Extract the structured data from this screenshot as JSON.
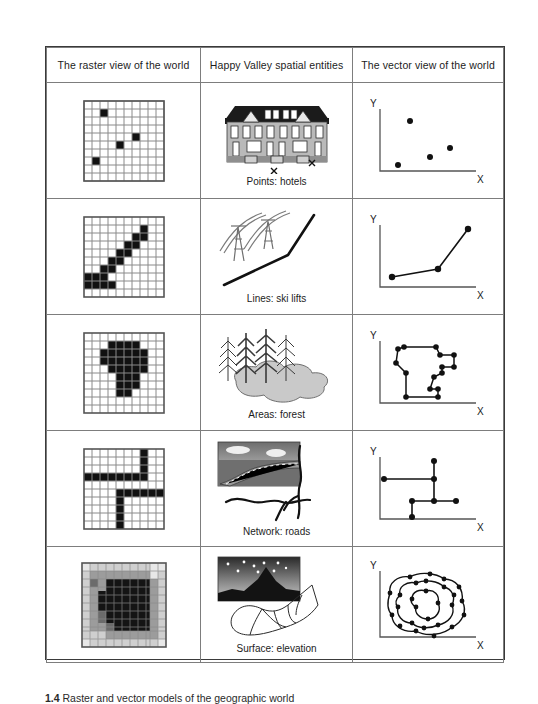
{
  "figure": {
    "caption_number": "1.4",
    "caption_text": "Raster and vector models of the geographic world"
  },
  "table": {
    "headers": [
      "The raster view of the world",
      "Happy Valley spatial entities",
      "The vector view of the world"
    ],
    "axis_labels": {
      "y": "Y",
      "x": "X"
    },
    "rows": [
      {
        "id": "points",
        "caption": "Points: hotels",
        "middle_art": "hotel-building-illustration",
        "middle_markers": "x-marks",
        "raster": {
          "type": "binary",
          "cols": 10,
          "rows": 10,
          "filled_cells": [
            [
              2,
              1
            ],
            [
              6,
              4
            ],
            [
              4,
              5
            ],
            [
              1,
              7
            ]
          ]
        },
        "vector": {
          "type": "points",
          "points": [
            [
              28,
              18
            ],
            [
              62,
              55
            ],
            [
              46,
              66
            ],
            [
              18,
              78
            ]
          ]
        }
      },
      {
        "id": "lines",
        "caption": "Lines: ski lifts",
        "middle_art": "ski-lift-towers-illustration",
        "raster": {
          "type": "binary",
          "cols": 10,
          "rows": 10,
          "filled_cells": [
            [
              7,
              1
            ],
            [
              7,
              2
            ],
            [
              6,
              2
            ],
            [
              6,
              3
            ],
            [
              5,
              3
            ],
            [
              5,
              4
            ],
            [
              4,
              4
            ],
            [
              4,
              5
            ],
            [
              3,
              5
            ],
            [
              3,
              6
            ],
            [
              2,
              6
            ],
            [
              1,
              7
            ],
            [
              2,
              7
            ],
            [
              3,
              7
            ],
            [
              0,
              7
            ],
            [
              0,
              8
            ],
            [
              1,
              8
            ],
            [
              2,
              8
            ],
            [
              3,
              8
            ]
          ]
        },
        "vector": {
          "type": "polyline",
          "points": [
            [
              12,
              78
            ],
            [
              62,
              62
            ],
            [
              88,
              12
            ]
          ]
        }
      },
      {
        "id": "areas",
        "caption": "Areas: forest",
        "middle_art": "forest-trees-and-lake-illustration",
        "raster": {
          "type": "binary",
          "cols": 10,
          "rows": 10,
          "filled_cells": [
            [
              3,
              1
            ],
            [
              4,
              1
            ],
            [
              5,
              1
            ],
            [
              6,
              1
            ],
            [
              2,
              2
            ],
            [
              3,
              2
            ],
            [
              4,
              2
            ],
            [
              5,
              2
            ],
            [
              6,
              2
            ],
            [
              7,
              2
            ],
            [
              2,
              3
            ],
            [
              3,
              3
            ],
            [
              4,
              3
            ],
            [
              5,
              3
            ],
            [
              6,
              3
            ],
            [
              7,
              3
            ],
            [
              3,
              4
            ],
            [
              4,
              4
            ],
            [
              5,
              4
            ],
            [
              6,
              4
            ],
            [
              7,
              4
            ],
            [
              4,
              5
            ],
            [
              5,
              5
            ],
            [
              6,
              5
            ],
            [
              4,
              6
            ],
            [
              5,
              6
            ],
            [
              6,
              6
            ],
            [
              4,
              7
            ],
            [
              5,
              7
            ]
          ]
        },
        "vector": {
          "type": "polygon",
          "points": [
            [
              24,
              12
            ],
            [
              56,
              12
            ],
            [
              60,
              22
            ],
            [
              78,
              22
            ],
            [
              78,
              38
            ],
            [
              62,
              38
            ],
            [
              62,
              48
            ],
            [
              52,
              52
            ],
            [
              48,
              70
            ],
            [
              62,
              70
            ],
            [
              62,
              82
            ],
            [
              24,
              82
            ],
            [
              24,
              52
            ],
            [
              12,
              40
            ],
            [
              14,
              22
            ]
          ]
        }
      },
      {
        "id": "network",
        "caption": "Network: roads",
        "middle_art": "road-photo-and-road-network-illustration",
        "raster": {
          "type": "binary",
          "cols": 10,
          "rows": 10,
          "filled_cells": [
            [
              7,
              0
            ],
            [
              7,
              1
            ],
            [
              7,
              2
            ],
            [
              0,
              3
            ],
            [
              1,
              3
            ],
            [
              2,
              3
            ],
            [
              3,
              3
            ],
            [
              4,
              3
            ],
            [
              5,
              3
            ],
            [
              6,
              3
            ],
            [
              7,
              3
            ],
            [
              7,
              4
            ],
            [
              4,
              5
            ],
            [
              5,
              5
            ],
            [
              6,
              5
            ],
            [
              7,
              5
            ],
            [
              8,
              5
            ],
            [
              9,
              5
            ],
            [
              4,
              6
            ],
            [
              4,
              7
            ],
            [
              4,
              8
            ],
            [
              4,
              9
            ]
          ]
        },
        "vector": {
          "type": "network",
          "nodes": [
            [
              8,
              36
            ],
            [
              62,
              36
            ],
            [
              62,
              8
            ],
            [
              40,
              66
            ],
            [
              62,
              66
            ],
            [
              86,
              66
            ],
            [
              40,
              94
            ]
          ],
          "edges": [
            [
              0,
              1
            ],
            [
              1,
              2
            ],
            [
              1,
              4
            ],
            [
              3,
              4
            ],
            [
              4,
              5
            ],
            [
              3,
              6
            ]
          ]
        }
      },
      {
        "id": "surface",
        "caption": "Surface: elevation",
        "middle_art": "mountain-night-photo-and-tin-surface-illustration",
        "raster": {
          "type": "grayscale",
          "cols": 11,
          "rows": 11,
          "levels": [
            "#000000",
            "#4d4d4d",
            "#9a9a9a",
            "#d4d4d4",
            "#ffffff"
          ]
        },
        "vector": {
          "type": "contours",
          "contour_count": 3
        }
      }
    ]
  }
}
